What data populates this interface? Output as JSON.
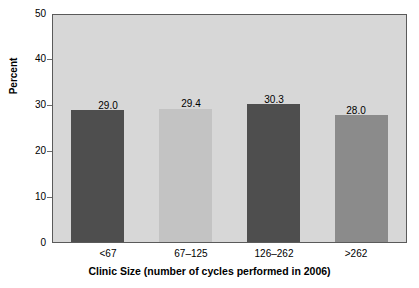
{
  "chart_data": {
    "type": "bar",
    "title": "",
    "xlabel": "Clinic Size (number of cycles performed in 2006)",
    "ylabel": "Percent",
    "categories": [
      "<67",
      "67–125",
      "126–262",
      ">262"
    ],
    "values": [
      29.0,
      29.4,
      30.3,
      28.0
    ],
    "value_labels": [
      "29.0",
      "29.4",
      "30.3",
      "28.0"
    ],
    "bar_colors": [
      "#4e4e4e",
      "#c3c3c3",
      "#4e4e4e",
      "#8b8b8b"
    ],
    "ylim": [
      0,
      50
    ],
    "yticks": [
      0,
      10,
      20,
      30,
      40,
      50
    ],
    "ytick_labels": [
      "0",
      "10",
      "20",
      "30",
      "40",
      "50"
    ],
    "grid": false,
    "legend": null,
    "plot_background": "#d7d7d7",
    "page_background": "#ffffff",
    "axis_color": "#5a5a5a"
  }
}
